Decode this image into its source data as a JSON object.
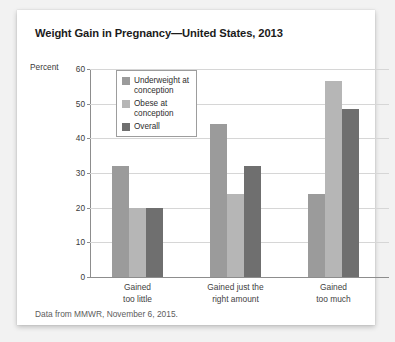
{
  "card": {
    "title": "Weight Gain in Pregnancy—United States, 2013",
    "source": "Data from MMWR, November 6, 2015."
  },
  "chart_data": {
    "type": "bar",
    "title": "Weight Gain in Pregnancy—United States, 2013",
    "subtitle": "",
    "xlabel": "",
    "ylabel": "Percent",
    "ylim": [
      0,
      60
    ],
    "yticks": [
      0,
      10,
      20,
      30,
      40,
      50,
      60
    ],
    "ytick_labels": [
      "0",
      "10",
      "20",
      "30",
      "40",
      "50",
      "60"
    ],
    "grid": true,
    "legend_position": "upper-left-inside",
    "categories": [
      "Gained\ntoo little",
      "Gained just the\nright amount",
      "Gained\ntoo much"
    ],
    "series": [
      {
        "name": "Underweight at conception",
        "color": "#9b9b9b",
        "values": [
          32,
          44,
          24
        ]
      },
      {
        "name": "Obese at conception",
        "color": "#b6b6b6",
        "values": [
          20,
          24,
          56.5
        ]
      },
      {
        "name": "Overall",
        "color": "#6f6f6f",
        "values": [
          20,
          32,
          48.5
        ]
      }
    ],
    "annotations": [
      "Data from MMWR, November 6, 2015."
    ]
  }
}
